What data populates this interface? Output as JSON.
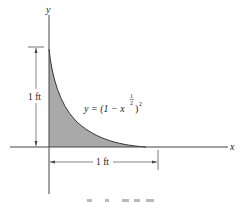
{
  "figure": {
    "axis_x_label": "x",
    "axis_y_label": "y",
    "equation": {
      "lhs": "y = (1 − x",
      "exponent_num": "1",
      "exponent_den": "2",
      "rhs": ")",
      "outer_exponent": "2"
    },
    "dim_vertical_label": "1 ft",
    "dim_horizontal_label": "1 ft",
    "colors": {
      "shade": "#a9a9a9",
      "line": "#333333"
    }
  }
}
